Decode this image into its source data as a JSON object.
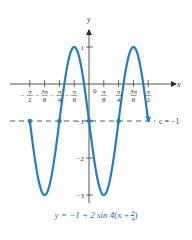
{
  "chart_data": {
    "type": "line",
    "title": "",
    "caption": "y = −1 + 2 sin 4(x + π/4)",
    "caption_parts": {
      "lhs": "y = −1 + 2 sin 4",
      "open": "(x + ",
      "num": "π",
      "den": "4",
      "close": ")"
    },
    "xlabel": "x",
    "ylabel": "y",
    "x_ticks": [
      {
        "value": -1.5708,
        "label_num": "π",
        "label_den": "2",
        "neg": true
      },
      {
        "value": -1.1781,
        "label_num": "3π",
        "label_den": "8",
        "neg": true
      },
      {
        "value": -0.7854,
        "label_num": "π",
        "label_den": "4",
        "neg": true
      },
      {
        "value": -0.3927,
        "label_num": "π",
        "label_den": "8",
        "neg": true
      },
      {
        "value": 0.3927,
        "label_num": "π",
        "label_den": "8",
        "neg": false
      },
      {
        "value": 0.7854,
        "label_num": "π",
        "label_den": "4",
        "neg": false
      },
      {
        "value": 1.1781,
        "label_num": "3π",
        "label_den": "8",
        "neg": false
      },
      {
        "value": 1.5708,
        "label_num": "π",
        "label_den": "2",
        "neg": false
      }
    ],
    "origin_label": "0",
    "y_ticks": [
      {
        "value": 1,
        "label": "1"
      },
      {
        "value": -1,
        "label": "−1"
      },
      {
        "value": -2,
        "label": "−2"
      },
      {
        "value": -3,
        "label": "−3"
      }
    ],
    "series": [
      {
        "name": "y = −1 + 2 sin 4(x + π/4)",
        "color": "#1f7fc4",
        "x_range": [
          -1.5708,
          1.5708
        ],
        "points": [
          {
            "x": -1.5708,
            "y": -1
          },
          {
            "x": -1.1781,
            "y": -3
          },
          {
            "x": -0.7854,
            "y": -1
          },
          {
            "x": -0.3927,
            "y": 1
          },
          {
            "x": 0,
            "y": -1
          },
          {
            "x": 0.3927,
            "y": -3
          },
          {
            "x": 0.7854,
            "y": -1
          },
          {
            "x": 1.1781,
            "y": 1
          },
          {
            "x": 1.5708,
            "y": -1
          }
        ]
      }
    ],
    "midline": {
      "value": -1,
      "label": "c = −1",
      "style": "dashed"
    },
    "marked_points_x": [
      -1.5708,
      -0.7854,
      0,
      0.7854
    ],
    "end_arrow_x": 1.5708,
    "xlim": [
      -1.85,
      1.95
    ],
    "ylim": [
      -3.3,
      1.6
    ],
    "grid": false,
    "legend": "none"
  }
}
